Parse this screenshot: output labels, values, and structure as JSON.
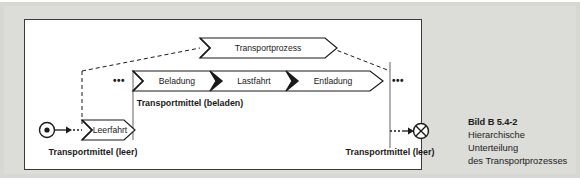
{
  "figure": {
    "caption_title": "Bild B 5.4-2",
    "caption_lines": [
      "Hierarchische",
      "Unterteilung",
      "des Transportprozesses"
    ]
  },
  "diagram": {
    "type": "hierarchical-process-decomposition",
    "top_level": {
      "chevron_label": "Transportprozess"
    },
    "middle_level": {
      "chevrons": [
        {
          "label": "Beladung"
        },
        {
          "label": "Lastfahrt"
        },
        {
          "label": "Entladung"
        }
      ],
      "resource_label": "Transportmittel (beladen)",
      "left_ellipsis": "•••",
      "right_ellipsis": "•••"
    },
    "bottom_level": {
      "chevron_label": "Leerfahrt",
      "start_resource_label": "Transportmittel (leer)",
      "end_resource_label": "Transportmittel (leer)",
      "start_node_icon": "filled-dot-start-node",
      "end_node_icon": "circled-x-end-node"
    }
  },
  "colors": {
    "background": "#dcdcd9",
    "panel": "#ffffff",
    "stroke": "#1a1a1a",
    "text": "#1a1a1a",
    "guide": "#8a8a8a"
  }
}
